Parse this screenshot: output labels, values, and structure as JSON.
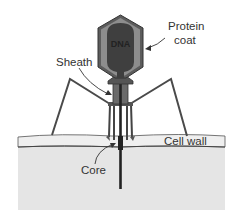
{
  "diagram": {
    "labels": {
      "dna": "DNA",
      "protein_coat_line1": "Protein",
      "protein_coat_line2": "coat",
      "sheath": "Sheath",
      "cell_wall": "Cell wall",
      "core": "Core"
    },
    "colors": {
      "head_outer": "#5a5a5a",
      "head_mid": "#8a8a8a",
      "dna_fill": "#3e3e3e",
      "cell_fill": "#e4e4e4",
      "wall_fill": "#ececec",
      "line": "#333333"
    }
  }
}
